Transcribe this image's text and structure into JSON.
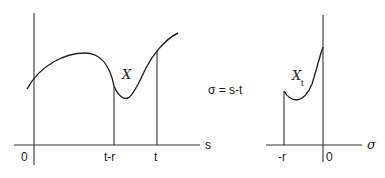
{
  "left_panel": {
    "origin_label": "0",
    "x_axis_label": "s",
    "tick_labels": [
      "t-r",
      "t"
    ],
    "curve_label": "X"
  },
  "transform_label": "σ = s-t",
  "right_panel": {
    "origin_label": "0",
    "x_axis_label": "σ",
    "tick_labels": [
      "-r"
    ],
    "curve_label": "X",
    "curve_label_subscript": "t"
  }
}
